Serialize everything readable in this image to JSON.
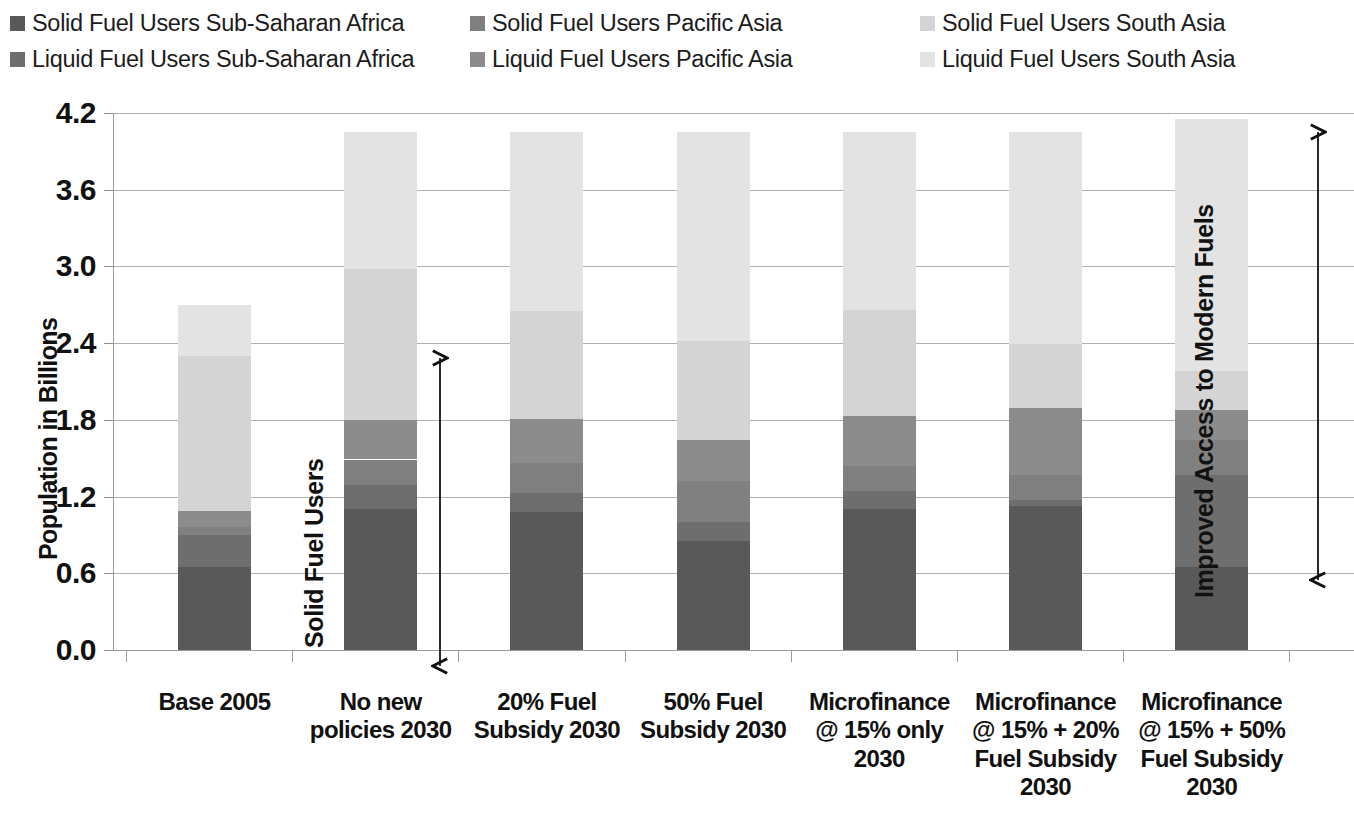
{
  "legend": {
    "items": [
      {
        "label": "Solid Fuel Users Sub-Saharan Africa",
        "color": "#595959",
        "key": "solid_ssa",
        "col": 0,
        "row": 0
      },
      {
        "label": "Liquid Fuel Users Sub-Saharan Africa",
        "color": "#6e6e6e",
        "key": "liquid_ssa",
        "col": 0,
        "row": 1
      },
      {
        "label": "Solid Fuel Users Pacific Asia",
        "color": "#808080",
        "key": "solid_pac",
        "col": 1,
        "row": 0
      },
      {
        "label": "Liquid Fuel Users Pacific Asia",
        "color": "#8c8c8c",
        "key": "liquid_pac",
        "col": 1,
        "row": 1
      },
      {
        "label": "Solid Fuel Users South Asia",
        "color": "#d4d4d4",
        "key": "solid_south",
        "col": 2,
        "row": 0
      },
      {
        "label": "Liquid Fuel Users South Asia",
        "color": "#e3e3e3",
        "key": "liquid_south",
        "col": 2,
        "row": 1
      }
    ]
  },
  "annotations": {
    "left_bracket_label": "Solid Fuel Users",
    "right_bracket_label": "Improved Access to Modern Fuels"
  },
  "chart_data": {
    "type": "bar",
    "stacked": true,
    "title": "",
    "xlabel": "",
    "ylabel": "Population in Billions",
    "ylim": [
      0.0,
      4.2
    ],
    "ytick_step": 0.6,
    "ytick_labels": [
      "4.2",
      "3.6",
      "3.0",
      "2.4",
      "1.8",
      "1.2",
      "0.6",
      "0.0"
    ],
    "ytick_values": [
      4.2,
      3.6,
      3.0,
      2.4,
      1.8,
      1.2,
      0.6,
      0.0
    ],
    "grid": true,
    "legend_position": "top",
    "categories": [
      "Base 2005",
      "No new policies 2030",
      "20% Fuel Subsidy 2030",
      "50% Fuel Subsidy 2030",
      "Microfinance @ 15% only 2030",
      "Microfinance @ 15% + 20% Fuel Subsidy 2030",
      "Microfinance @ 15% + 50% Fuel Subsidy 2030"
    ],
    "category_label_lines": [
      [
        "Base 2005"
      ],
      [
        "No new",
        "policies 2030"
      ],
      [
        "20% Fuel",
        "Subsidy 2030"
      ],
      [
        "50% Fuel",
        "Subsidy 2030"
      ],
      [
        "Microfinance",
        "@ 15% only",
        "2030"
      ],
      [
        "Microfinance",
        "@ 15% + 20%",
        "Fuel Subsidy",
        "2030"
      ],
      [
        "Microfinance",
        "@ 15% + 50%",
        "Fuel Subsidy",
        "2030"
      ]
    ],
    "series": [
      {
        "name": "Solid Fuel Users Sub-Saharan Africa",
        "key": "solid_ssa",
        "color": "#595959",
        "values": [
          0.65,
          1.1,
          1.08,
          0.85,
          1.1,
          1.13,
          0.65
        ]
      },
      {
        "name": "Liquid Fuel Users Sub-Saharan Africa",
        "key": "liquid_ssa",
        "color": "#6e6e6e",
        "values": [
          0.25,
          0.19,
          0.15,
          0.15,
          0.14,
          0.04,
          0.72
        ]
      },
      {
        "name": "Solid Fuel Users Pacific Asia",
        "key": "solid_pac",
        "color": "#808080",
        "values": [
          0.06,
          0.2,
          0.23,
          0.32,
          0.2,
          0.2,
          0.27
        ]
      },
      {
        "name": "Liquid Fuel Users Pacific Asia",
        "key": "liquid_pac",
        "color": "#8c8c8c",
        "values": [
          0.13,
          0.31,
          0.35,
          0.32,
          0.39,
          0.52,
          0.24
        ]
      },
      {
        "name": "Solid Fuel Users South Asia",
        "key": "solid_south",
        "color": "#d4d4d4",
        "values": [
          1.21,
          1.18,
          0.84,
          0.78,
          0.83,
          0.5,
          0.3
        ]
      },
      {
        "name": "Liquid Fuel Users South Asia",
        "key": "liquid_south",
        "color": "#e3e3e3",
        "values": [
          0.4,
          1.07,
          1.4,
          1.63,
          1.39,
          1.66,
          1.97
        ]
      }
    ],
    "totals": [
      2.7,
      4.05,
      4.05,
      4.05,
      4.05,
      4.05,
      4.15
    ]
  }
}
